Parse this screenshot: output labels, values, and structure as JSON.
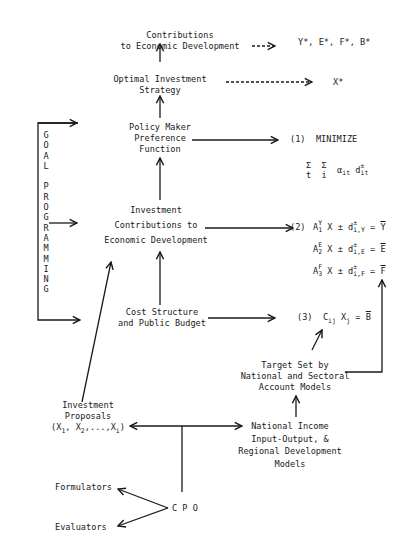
{
  "diagram": {
    "nodes": {
      "contributions": {
        "lines": [
          "Contributions",
          "to Economic Development"
        ]
      },
      "optimal_strategy": {
        "lines": [
          "Optimal Investment",
          "Strategy"
        ]
      },
      "policy_maker": {
        "lines": [
          "Policy Maker",
          "Preference",
          "Function"
        ]
      },
      "investment_contrib": {
        "lines": [
          "Investment",
          "Contributions to",
          "Economic Development"
        ]
      },
      "cost_structure": {
        "lines": [
          "Cost Structure",
          "and Public Budget"
        ]
      },
      "target_set": {
        "lines": [
          "Target Set by",
          "National and Sectoral",
          "Account Models"
        ]
      },
      "investment_proposals": {
        "lines": [
          "Investment",
          "Proposals"
        ],
        "vector": {
          "open": "(X",
          "s1": "1",
          "sep1": ", X",
          "s2": "2",
          "sep2": ",...,X",
          "s3": "i",
          "close": ")"
        }
      },
      "national_income": {
        "lines": [
          "National Income",
          "Input-Output, &",
          "Regional Development",
          "Models"
        ]
      },
      "formulators": {
        "label": "Formulators"
      },
      "evaluators": {
        "label": "Evaluators"
      },
      "cpo": {
        "label": "C P O"
      }
    },
    "outputs": {
      "top": "Y*, E*, F*, B*",
      "strategy": "X*"
    },
    "goal_programming": {
      "letters": [
        "G",
        "O",
        "A",
        "L",
        "",
        "P",
        "R",
        "O",
        "G",
        "R",
        "A",
        "M",
        "M",
        "I",
        "N",
        "G"
      ]
    },
    "equations": {
      "eq1": {
        "number": "(1)",
        "label": "MINIMIZE",
        "sum_t": "Σ",
        "sum_i": "Σ",
        "t": "t",
        "i": "i",
        "alpha": "α",
        "alpha_sub": "it",
        "d": "d",
        "d_sup": "±",
        "d_sub": "it"
      },
      "eq2": {
        "number": "(2)",
        "rows": [
          {
            "A": "A",
            "sup": "Y",
            "sub": "1",
            "mid": " X ± d",
            "dsup": "±",
            "dsub": "i,Y",
            "eq": " = ",
            "rhs": "Y"
          },
          {
            "A": "A",
            "sup": "E",
            "sub": "2",
            "mid": " X ± d",
            "dsup": "±",
            "dsub": "i,E",
            "eq": " = ",
            "rhs": "E"
          },
          {
            "A": "A",
            "sup": "F",
            "sub": "3",
            "mid": " X ± d",
            "dsup": "±",
            "dsub": "i,F",
            "eq": " = ",
            "rhs": "F"
          }
        ]
      },
      "eq3": {
        "number": "(3)",
        "C": "C",
        "C_sub": "ij",
        "X": " X",
        "X_sub": "j",
        "eq": " = ",
        "rhs": "B"
      }
    },
    "colors": {
      "ink": "#1a1a1a",
      "background": "#ffffff"
    }
  }
}
